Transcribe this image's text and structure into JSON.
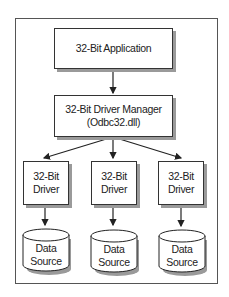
{
  "diagram": {
    "application": {
      "line1": "32-Bit Application"
    },
    "driver_manager": {
      "line1": "32-Bit Driver Manager",
      "line2": "(Odbc32.dll)"
    },
    "drivers": [
      {
        "line1": "32-Bit",
        "line2": "Driver"
      },
      {
        "line1": "32-Bit",
        "line2": "Driver"
      },
      {
        "line1": "32-Bit",
        "line2": "Driver"
      }
    ],
    "data_sources": [
      {
        "line1": "Data",
        "line2": "Source"
      },
      {
        "line1": "Data",
        "line2": "Source"
      },
      {
        "line1": "Data",
        "line2": "Source"
      }
    ],
    "colors": {
      "line": "#222222",
      "shadow": "#9a9a9a",
      "frame": "#555555"
    }
  }
}
